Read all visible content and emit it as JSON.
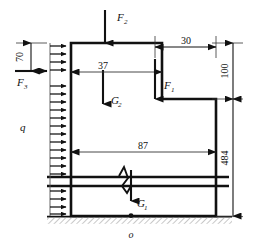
{
  "figure": {
    "type": "engineering-free-body-diagram",
    "origin_label": "o",
    "colors": {
      "outline": "#111111",
      "dimension": "#333333",
      "ground_hatch": "#888888",
      "background": "#ffffff"
    }
  },
  "forces": [
    {
      "name": "F1",
      "label": "F",
      "subscript": "1",
      "direction": "down"
    },
    {
      "name": "F2",
      "label": "F",
      "subscript": "2",
      "direction": "down"
    },
    {
      "name": "F3",
      "label": "F",
      "subscript": "3",
      "direction": "right"
    },
    {
      "name": "G1",
      "label": "G",
      "subscript": "1",
      "direction": "down"
    },
    {
      "name": "G2",
      "label": "G",
      "subscript": "2",
      "direction": "down"
    },
    {
      "name": "q",
      "label": "q",
      "subscript": "",
      "direction": "right"
    }
  ],
  "dimensions": [
    {
      "name": "dim-70",
      "value": "70",
      "orientation": "vertical"
    },
    {
      "name": "dim-37",
      "value": "37",
      "orientation": "horizontal"
    },
    {
      "name": "dim-30",
      "value": "30",
      "orientation": "horizontal"
    },
    {
      "name": "dim-100",
      "value": "100",
      "orientation": "vertical"
    },
    {
      "name": "dim-87",
      "value": "87",
      "orientation": "horizontal"
    },
    {
      "name": "dim-484",
      "value": "484",
      "orientation": "vertical"
    }
  ],
  "labels": {
    "F1": "F",
    "F1_sub": "1",
    "F2": "F",
    "F2_sub": "2",
    "F3": "F",
    "F3_sub": "3",
    "G1": "G",
    "G1_sub": "1",
    "G2": "G",
    "G2_sub": "2",
    "q": "q",
    "origin": "o",
    "d70": "70",
    "d37": "37",
    "d30": "30",
    "d100": "100",
    "d87": "87",
    "d484": "484"
  }
}
